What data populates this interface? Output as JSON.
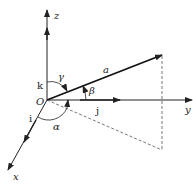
{
  "diagram": {
    "origin_label": "O",
    "axes": [
      {
        "name": "x",
        "label": "x",
        "unit_vector": "i"
      },
      {
        "name": "y",
        "label": "y",
        "unit_vector": "j"
      },
      {
        "name": "z",
        "label": "z",
        "unit_vector": "k"
      }
    ],
    "vector": {
      "label": "a"
    },
    "angles": [
      {
        "label": "α",
        "between": "a and x-axis"
      },
      {
        "label": "β",
        "between": "a and y-axis"
      },
      {
        "label": "γ",
        "between": "a and z-axis"
      }
    ],
    "colors": {
      "stroke": "#222222",
      "dashed": "#555555"
    }
  }
}
